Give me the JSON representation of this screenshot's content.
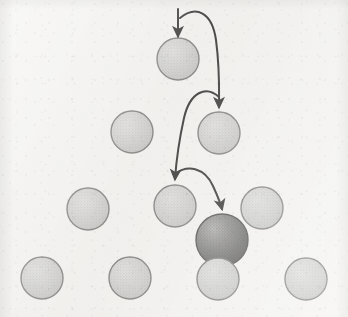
{
  "figure": {
    "kind": "node-diagram",
    "canvas": {
      "width": 348,
      "height": 317
    },
    "background_color": "#f2f1ef"
  },
  "style": {
    "node_fill": "#c9c9c7",
    "node_fill_light": "#d7d7d5",
    "node_stroke": "#6f6f6d",
    "node_stroke_width": 1.4,
    "highlight_fill_light": "#a9a9a6",
    "highlight_fill_dark": "#4b4b49",
    "highlight_stroke": "#3c3c3a",
    "arrow_color": "#1d1d1b",
    "arrow_width": 2.0
  },
  "nodes": [
    {
      "id": "n-r1-c1",
      "label": "node-row1-1",
      "cx": 178,
      "cy": 59,
      "r": 21,
      "kind": "plain"
    },
    {
      "id": "n-r2-c1",
      "label": "node-row2-1",
      "cx": 132,
      "cy": 132,
      "r": 21,
      "kind": "plain"
    },
    {
      "id": "n-r2-c2",
      "label": "node-row2-2",
      "cx": 219,
      "cy": 133,
      "r": 21,
      "kind": "plain"
    },
    {
      "id": "n-r3-c1",
      "label": "node-row3-1",
      "cx": 88,
      "cy": 209,
      "r": 21,
      "kind": "plain"
    },
    {
      "id": "n-r3-c2",
      "label": "node-row3-2",
      "cx": 175,
      "cy": 206,
      "r": 21,
      "kind": "plain"
    },
    {
      "id": "n-r3-c3",
      "label": "node-row3-3",
      "cx": 262,
      "cy": 208,
      "r": 21,
      "kind": "plain"
    },
    {
      "id": "n-highlight",
      "label": "highlighted-sphere",
      "cx": 222,
      "cy": 240,
      "r": 26,
      "kind": "highlighted"
    },
    {
      "id": "n-r4-c1",
      "label": "node-row4-1",
      "cx": 42,
      "cy": 278,
      "r": 21,
      "kind": "plain"
    },
    {
      "id": "n-r4-c2",
      "label": "node-row4-2",
      "cx": 130,
      "cy": 278,
      "r": 21,
      "kind": "plain"
    },
    {
      "id": "n-r4-c3",
      "label": "node-row4-3",
      "cx": 218,
      "cy": 279,
      "r": 21,
      "kind": "plain"
    },
    {
      "id": "n-r4-c4",
      "label": "node-row4-4",
      "cx": 306,
      "cy": 279,
      "r": 21,
      "kind": "plain"
    }
  ],
  "arrows": [
    {
      "id": "arrow-entry",
      "label": "entry-arrow-into-top-node",
      "type": "straight",
      "path": "M 178 9 L 178 36",
      "head": {
        "x": 178,
        "y": 38,
        "angle": 90
      }
    },
    {
      "id": "arrow-1",
      "label": "arrow-top-node-to-row2-right",
      "type": "curved",
      "path": "M 180 18 C 196 5 212 12 216 40 C 220 70 219 92 219 107",
      "head": {
        "x": 219,
        "y": 110,
        "angle": 90
      }
    },
    {
      "id": "arrow-2",
      "label": "arrow-row2-right-to-row3-middle",
      "type": "curved",
      "path": "M 219 97 C 206 85 190 92 184 118 C 178 145 176 165 175 179",
      "head": {
        "x": 175,
        "y": 182,
        "angle": 92
      }
    },
    {
      "id": "arrow-3",
      "label": "arrow-row3-middle-to-highlighted-sphere",
      "type": "curved",
      "path": "M 175 174 C 188 164 205 168 213 186 C 218 197 221 205 222 209",
      "head": {
        "x": 222,
        "y": 212,
        "angle": 80
      }
    }
  ]
}
